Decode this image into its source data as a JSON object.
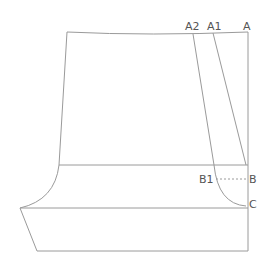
{
  "diagram": {
    "type": "pattern-drafting",
    "labels": {
      "A": "A",
      "A1": "A1",
      "A2": "A2",
      "B": "B",
      "B1": "B1",
      "C": "C"
    },
    "colors": {
      "line": "#9a9a9a",
      "text": "#555555",
      "background": "#ffffff"
    }
  }
}
